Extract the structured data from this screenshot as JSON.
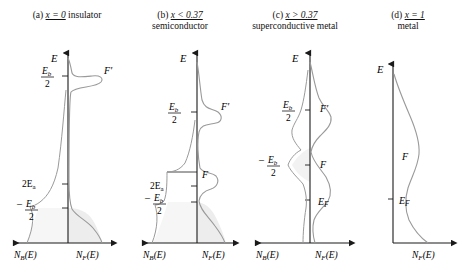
{
  "figure": {
    "type": "density-of-states-diagram",
    "width": 465,
    "height": 271,
    "background": "#ffffff",
    "ink": "#1a1a1a",
    "curve_color": "#8c8c8c",
    "shade_color": "#ededed"
  },
  "panels": [
    {
      "id": "a",
      "tag": "(a)",
      "condition": "x = 0",
      "kind": "insulator",
      "kind_on_second_line": false,
      "axis_left_label": "N_B(E)",
      "axis_right_label": "N_F(E)",
      "energy_axis_label": "E",
      "ticks": [
        {
          "name": "Eb_over_2",
          "num": "E",
          "sub": "b",
          "den": "2",
          "sign": ""
        },
        {
          "name": "two_Ea",
          "plain": "2E",
          "sub": "a"
        },
        {
          "name": "minus_Eb_over_2",
          "num": "E",
          "sub": "b",
          "den": "2",
          "sign": "–"
        }
      ],
      "curve_labels": [
        {
          "name": "F-prime",
          "text": "F'"
        }
      ],
      "has_left_axis": true,
      "has_shading": true
    },
    {
      "id": "b",
      "tag": "(b)",
      "condition": "x < 0.37",
      "kind": "semiconductor",
      "kind_on_second_line": true,
      "axis_left_label": "N_B(E)",
      "axis_right_label": "N_F(E)",
      "energy_axis_label": "E",
      "ticks": [
        {
          "name": "Eb_over_2",
          "num": "E",
          "sub": "b",
          "den": "2",
          "sign": ""
        },
        {
          "name": "two_Ea",
          "plain": "2E",
          "sub": "a"
        },
        {
          "name": "minus_Eb_over_2",
          "num": "E",
          "sub": "b",
          "den": "2",
          "sign": "–"
        }
      ],
      "curve_labels": [
        {
          "name": "F-prime",
          "text": "F'"
        },
        {
          "name": "F",
          "text": "F"
        }
      ],
      "has_left_axis": true,
      "has_shading": true
    },
    {
      "id": "c",
      "tag": "(c)",
      "condition": "x > 0.37",
      "kind": "superconductive metal",
      "kind_on_second_line": true,
      "axis_left_label": "N_B(E)",
      "axis_right_label": "N_F(E)",
      "energy_axis_label": "E",
      "ticks": [
        {
          "name": "Eb_over_2",
          "num": "E",
          "sub": "b",
          "den": "2",
          "sign": ""
        },
        {
          "name": "minus_Eb_over_2",
          "num": "E",
          "sub": "b",
          "den": "2",
          "sign": "–"
        }
      ],
      "curve_labels": [
        {
          "name": "F-prime",
          "text": "F'"
        },
        {
          "name": "F",
          "text": "F"
        },
        {
          "name": "E-fermi",
          "text": "E",
          "sub": "F"
        }
      ],
      "has_left_axis": true,
      "has_shading": true
    },
    {
      "id": "d",
      "tag": "(d)",
      "condition": "x = 1",
      "kind": "metal",
      "kind_on_second_line": true,
      "axis_left_label": "",
      "axis_right_label": "N_F(E)",
      "energy_axis_label": "E",
      "ticks": [],
      "curve_labels": [
        {
          "name": "F",
          "text": "F"
        },
        {
          "name": "E-fermi",
          "text": "E",
          "sub": "F"
        }
      ],
      "has_left_axis": false,
      "has_shading": false
    }
  ],
  "axis_glyphs": {
    "n_b": {
      "main": "N",
      "sub": "B",
      "arg": "(E)"
    },
    "n_f": {
      "main": "N",
      "sub": "F",
      "arg": "(E)"
    }
  }
}
